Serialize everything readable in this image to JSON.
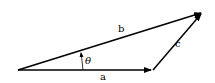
{
  "diagram": {
    "vectors": [
      {
        "name": "a",
        "label": "a",
        "from": [
          18,
          70
        ],
        "to": [
          153,
          70
        ]
      },
      {
        "name": "b",
        "label": "b",
        "from": [
          18,
          70
        ],
        "to": [
          203,
          12
        ]
      },
      {
        "name": "c",
        "label": "c",
        "from": [
          153,
          70
        ],
        "to": [
          203,
          12
        ]
      }
    ],
    "angle": {
      "label": "θ",
      "between": [
        "a",
        "b"
      ]
    },
    "colors": {
      "stroke": "#000000",
      "background": "#ffffff"
    }
  }
}
